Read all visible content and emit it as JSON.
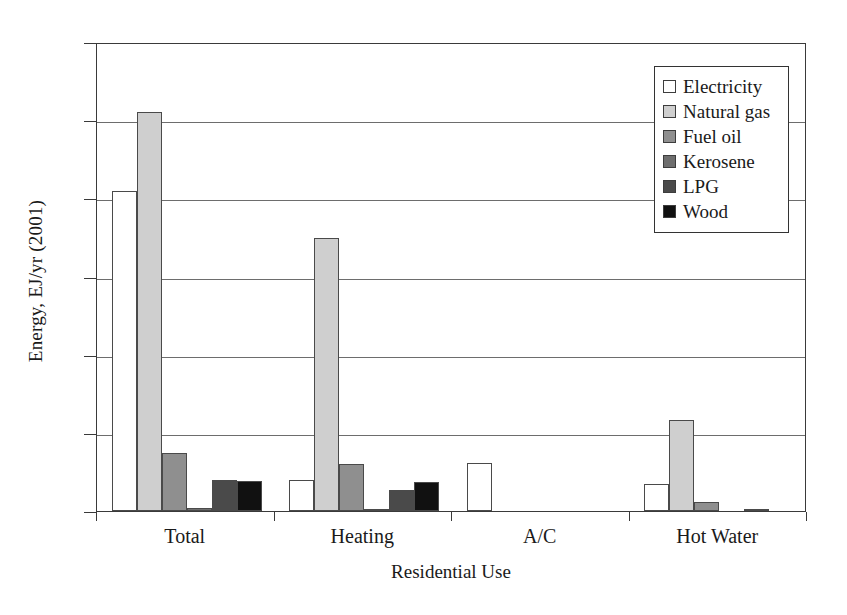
{
  "chart_data": {
    "type": "bar",
    "title": "",
    "xlabel": "Residential Use",
    "ylabel": "Energy, EJ/yr (2001)",
    "categories": [
      "Total",
      "Heating",
      "A/C",
      "Hot Water"
    ],
    "ylim": [
      0,
      6
    ],
    "yticks": [
      "0",
      "1",
      "2",
      "3",
      "4",
      "5",
      "6"
    ],
    "grid": true,
    "legend_position": "top-right",
    "series": [
      {
        "name": "Electricity",
        "color": "#ffffff",
        "values": [
          4.09,
          0.4,
          0.62,
          0.34
        ]
      },
      {
        "name": "Natural gas",
        "color": "#cfcfcf",
        "values": [
          5.11,
          3.49,
          0.0,
          1.17
        ]
      },
      {
        "name": "Fuel oil",
        "color": "#8f8f8f",
        "values": [
          0.74,
          0.6,
          0.0,
          0.11
        ]
      },
      {
        "name": "Kerosene",
        "color": "#6e6e6e",
        "values": [
          0.04,
          0.03,
          0.0,
          0.0
        ]
      },
      {
        "name": "LPG",
        "color": "#4a4a4a",
        "values": [
          0.4,
          0.27,
          0.0,
          0.03
        ]
      },
      {
        "name": "Wood",
        "color": "#111111",
        "values": [
          0.38,
          0.37,
          0.0,
          0.0
        ]
      }
    ]
  }
}
